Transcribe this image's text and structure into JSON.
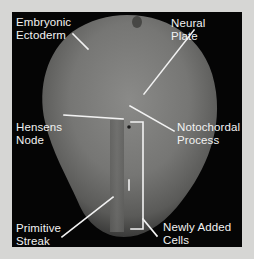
{
  "figure": {
    "background_color": "#d6d6d4",
    "panel_color": "#050505",
    "line_color": "#f2f2f2",
    "labels": {
      "embryonic_ectoderm": "Embryonic\nEctoderm",
      "neural_plate": "Neural\nPlate",
      "hensens_node": "Hensens\nNode",
      "notochordal_process": "Notochordal\nProcess",
      "primitive_streak": "Primitive\nStreak",
      "newly_added_cells": "Newly Added\nCells"
    }
  }
}
